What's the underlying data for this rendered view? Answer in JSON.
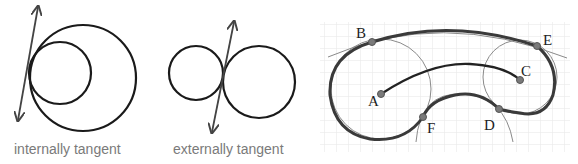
{
  "panels": [
    {
      "id": "internally-tangent",
      "caption": "internally tangent"
    },
    {
      "id": "externally-tangent",
      "caption": "externally tangent"
    },
    {
      "id": "arc-construction",
      "points": [
        {
          "name": "B",
          "label": "B"
        },
        {
          "name": "E",
          "label": "E"
        },
        {
          "name": "C",
          "label": "C"
        },
        {
          "name": "A",
          "label": "A"
        },
        {
          "name": "F",
          "label": "F"
        },
        {
          "name": "D",
          "label": "D"
        }
      ]
    }
  ],
  "colors": {
    "stroke": "#1a1a1a",
    "thick_curve": "#3a3a3a",
    "thin_circle": "#888888",
    "point_fill": "#7a7a7a",
    "grid": "#e4e4e4",
    "caption": "#7a7a7a"
  }
}
